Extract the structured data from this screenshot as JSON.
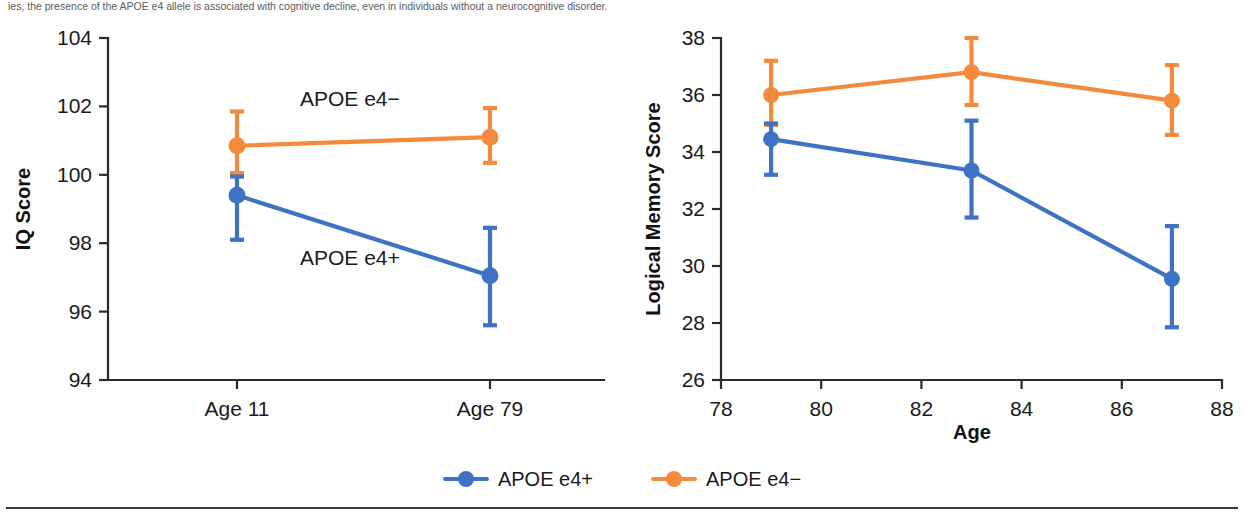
{
  "caption": {
    "text": "ies, the presence of the APOE e4 allele is associated with cognitive decline, even in individuals without a neurocognitive disorder."
  },
  "colors": {
    "e4_positive": "#3D72C4",
    "e4_negative": "#F58A3C",
    "axis": "#2b2b2b",
    "text": "#1a1a1a"
  },
  "legend": {
    "position": "bottom-center",
    "items": [
      {
        "label": "APOE e4+",
        "color": "#3D72C4",
        "marker": "circle-line"
      },
      {
        "label": "APOE e4−",
        "color": "#F58A3C",
        "marker": "circle-line"
      }
    ]
  },
  "chart_data": [
    {
      "id": "iq-panel",
      "type": "line",
      "title": "",
      "xlabel": "",
      "ylabel": "IQ Score",
      "categories": [
        "Age 11",
        "Age 79"
      ],
      "xticklabels": [
        "Age 11",
        "Age 79"
      ],
      "ylim": [
        94,
        104
      ],
      "yticks": [
        94,
        96,
        98,
        100,
        102,
        104
      ],
      "yticklabels": [
        "94",
        "96",
        "98",
        "100",
        "102",
        "104"
      ],
      "grid": false,
      "error_bars": "95% CI",
      "annotations": [
        {
          "text": "APOE e4−",
          "x_category": "Age 11",
          "series": "APOE e4−",
          "placement": "above-line"
        },
        {
          "text": "APOE e4+",
          "x_category": "Age 11",
          "series": "APOE e4+",
          "placement": "below-line"
        }
      ],
      "series": [
        {
          "name": "APOE e4−",
          "color": "#F58A3C",
          "values": [
            100.85,
            101.1
          ],
          "err_low": [
            100.05,
            100.35
          ],
          "err_high": [
            101.85,
            101.95
          ]
        },
        {
          "name": "APOE e4+",
          "color": "#3D72C4",
          "values": [
            99.4,
            97.05
          ],
          "err_low": [
            98.1,
            95.6
          ],
          "err_high": [
            99.95,
            98.45
          ]
        }
      ]
    },
    {
      "id": "logical-memory-panel",
      "type": "line",
      "title": "",
      "xlabel": "Age",
      "ylabel": "Logical Memory Score",
      "x": [
        79,
        83,
        87
      ],
      "xlim": [
        78,
        88
      ],
      "xticks": [
        78,
        80,
        82,
        84,
        86,
        88
      ],
      "xticklabels": [
        "78",
        "80",
        "82",
        "84",
        "86",
        "88"
      ],
      "ylim": [
        26,
        38
      ],
      "yticks": [
        26,
        28,
        30,
        32,
        34,
        36,
        38
      ],
      "yticklabels": [
        "26",
        "28",
        "30",
        "32",
        "34",
        "36",
        "38"
      ],
      "grid": false,
      "error_bars": "95% CI",
      "series": [
        {
          "name": "APOE e4−",
          "color": "#F58A3C",
          "values": [
            36.0,
            36.8,
            35.8
          ],
          "err_low": [
            34.95,
            35.65,
            34.6
          ],
          "err_high": [
            37.2,
            38.0,
            37.05
          ]
        },
        {
          "name": "APOE e4+",
          "color": "#3D72C4",
          "values": [
            34.45,
            33.35,
            29.55
          ],
          "err_low": [
            33.2,
            31.7,
            27.85
          ],
          "err_high": [
            35.0,
            35.1,
            31.4
          ]
        }
      ]
    }
  ]
}
